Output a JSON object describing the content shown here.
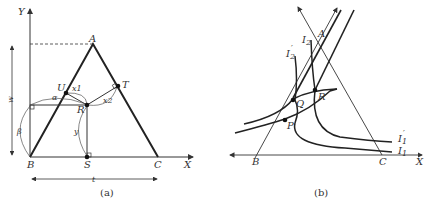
{
  "panel_a": {
    "caption": "(a)",
    "axis_labels": {
      "x": "X",
      "y": "Y"
    },
    "points": {
      "A": "A",
      "B": "B",
      "C": "C",
      "U": "U",
      "T": "T",
      "R": "R",
      "S": "S"
    },
    "distances": {
      "x1": "x1",
      "x2": "x2",
      "alpha": "α",
      "beta": "β",
      "y": "y",
      "w": "w",
      "t": "t"
    }
  },
  "panel_b": {
    "caption": "(b)",
    "axis_labels": {
      "x": "X"
    },
    "points": {
      "A": "A",
      "B": "B",
      "C": "C",
      "P": "P",
      "Q": "Q",
      "R": "R"
    },
    "curves": {
      "I1": "I",
      "I1_sub": "1",
      "I1p": "I",
      "I1p_sub": "1",
      "I1p_prime": "′",
      "I2": "I",
      "I2_sub": "2",
      "I2p": "I",
      "I2p_sub": "2",
      "I2p_prime": "′"
    }
  },
  "colors": {
    "ink": "#2a2a2a",
    "background": "#ffffff"
  }
}
